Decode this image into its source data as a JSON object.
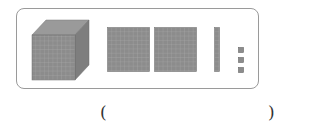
{
  "figure": {
    "blocks": [
      {
        "type": "thousand-cube",
        "count": 1
      },
      {
        "type": "hundred-flat",
        "count": 2
      },
      {
        "type": "ten-rod",
        "count": 1
      },
      {
        "type": "unit-cube",
        "count": 3
      }
    ],
    "colors": {
      "block_fill": "#8c8c8c",
      "grid_line": "#b4b4b4",
      "frame_border": "#9a9a9a"
    }
  },
  "answer": {
    "open_paren": "(",
    "close_paren": ")",
    "value": ""
  }
}
